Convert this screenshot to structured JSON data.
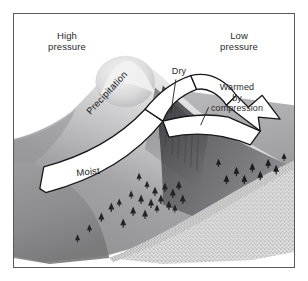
{
  "figure": {
    "name": "orographic-rain-shadow-diagram",
    "background_color": "#ffffff",
    "frame_color": "#5a5a5e"
  },
  "labels": {
    "high_pressure": "High\npressure",
    "low_pressure": "Low\npressure",
    "dry": "Dry",
    "warmed_by_compression": "Warmed\nby\ncompression",
    "moist": "Moist",
    "precipitation": "Precipitation"
  },
  "colors": {
    "sky": "#ffffff",
    "arrow_fill": "#ffffff",
    "arrow_outline": "#1d1d1f",
    "mountain_light": "#e8e8e8",
    "mountain_mid": "#9c9c9e",
    "mountain_dark": "#5e5e62",
    "leeward_slope": "#6f6f73",
    "desert_stipple": "#d8d8d8",
    "text": "#2a2a2c",
    "tree": "#242426"
  },
  "scene": {
    "windward_side": "left",
    "leeward_side": "right",
    "airflow_direction": "left-to-right",
    "features": [
      {
        "name": "windward-mountain-slope",
        "description": "moist vegetated slope rising to peak"
      },
      {
        "name": "mountain-peak",
        "description": "highlighted summit"
      },
      {
        "name": "leeward-slope",
        "description": "dry descending slope"
      },
      {
        "name": "desert-floor",
        "description": "stippled arid plain in rain shadow"
      },
      {
        "name": "airflow-arrow",
        "description": "white banded arrow rising over the range and descending"
      }
    ],
    "tree_count_windward": 22,
    "tree_count_leeward": 9
  }
}
